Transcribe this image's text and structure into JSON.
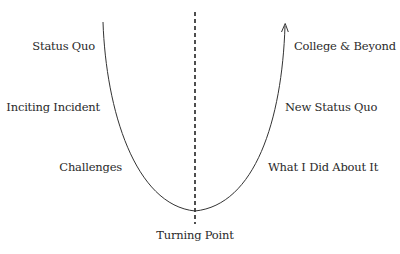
{
  "diagram": {
    "type": "narrative-arc",
    "left_labels": [
      {
        "text": "Status Quo"
      },
      {
        "text": "Inciting Incident"
      },
      {
        "text": "Challenges"
      }
    ],
    "right_labels": [
      {
        "text": "College & Beyond"
      },
      {
        "text": "New Status Quo"
      },
      {
        "text": "What I Did About It"
      }
    ],
    "bottom_label": {
      "text": "Turning Point"
    },
    "colors": {
      "line": "#333333",
      "text": "#2a2a2a",
      "background": "#ffffff"
    }
  }
}
